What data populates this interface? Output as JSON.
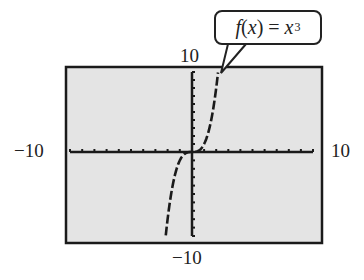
{
  "chart_data": {
    "type": "line",
    "title": "",
    "function": "f(x) = x^3",
    "annotation": "f(x) = x³",
    "xlabel": "",
    "ylabel": "",
    "xlim": [
      -10,
      10
    ],
    "ylim": [
      -10,
      10
    ],
    "xscale_ticks": 1,
    "yscale_ticks": 1,
    "grid": false,
    "tick_labels": {
      "x_min": "−10",
      "x_max": "10",
      "y_min": "−10",
      "y_max": "10"
    },
    "series": [
      {
        "name": "f(x) = x³",
        "x": [
          -2.15,
          -2,
          -1.75,
          -1.5,
          -1.25,
          -1,
          -0.75,
          -0.5,
          -0.25,
          0,
          0.25,
          0.5,
          0.75,
          1,
          1.25,
          1.5,
          1.75,
          2,
          2.15
        ],
        "y": [
          -9.94,
          -8,
          -5.36,
          -3.375,
          -1.95,
          -1,
          -0.42,
          -0.125,
          -0.016,
          0,
          0.016,
          0.125,
          0.42,
          1,
          1.95,
          3.375,
          5.36,
          8,
          9.94
        ]
      }
    ],
    "style": {
      "background": "#e4e4e4",
      "axis_color": "#1a1a1a",
      "curve_color": "#1a1a1a",
      "curve_dash": "dashed"
    }
  },
  "labels": {
    "y_max": "10",
    "y_min": "−10",
    "x_min": "−10",
    "x_max": "10",
    "callout_fx": "f",
    "callout_open": "(",
    "callout_x": "x",
    "callout_close": ")",
    "callout_eq": " = ",
    "callout_var": "x",
    "callout_exp": "3"
  }
}
